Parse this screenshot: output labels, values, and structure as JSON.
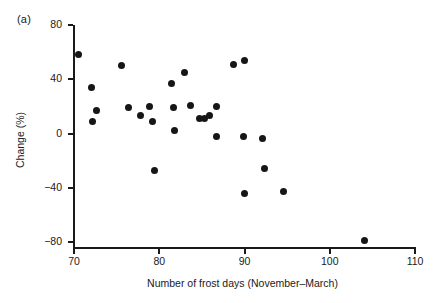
{
  "figure": {
    "panel_label": "(a)"
  },
  "chart_data": {
    "type": "scatter",
    "title": "",
    "xlabel": "Number of frost days (November–March)",
    "ylabel": "Change (%)",
    "xlim": [
      70,
      110
    ],
    "ylim": [
      -80,
      80
    ],
    "xticks": [
      70,
      80,
      90,
      100,
      110
    ],
    "xticklabels": [
      "70",
      "80",
      "90",
      "100",
      "110"
    ],
    "yticks": [
      80,
      40,
      0,
      -40,
      -80
    ],
    "yticklabels": [
      "80",
      "40",
      "0",
      "−40",
      "−80"
    ],
    "grid": false,
    "legend": null,
    "marker": "filled-circle",
    "marker_color": "#161616",
    "points": [
      {
        "x": 70.5,
        "y": 58
      },
      {
        "x": 72.1,
        "y": 34
      },
      {
        "x": 72.6,
        "y": 17
      },
      {
        "x": 72.2,
        "y": 9
      },
      {
        "x": 75.6,
        "y": 50
      },
      {
        "x": 76.4,
        "y": 19
      },
      {
        "x": 77.8,
        "y": 13
      },
      {
        "x": 78.8,
        "y": 20
      },
      {
        "x": 79.2,
        "y": 9
      },
      {
        "x": 79.4,
        "y": -27
      },
      {
        "x": 81.4,
        "y": 37
      },
      {
        "x": 81.7,
        "y": 19
      },
      {
        "x": 81.8,
        "y": 2
      },
      {
        "x": 83.0,
        "y": 45
      },
      {
        "x": 83.7,
        "y": 21
      },
      {
        "x": 84.7,
        "y": 11
      },
      {
        "x": 85.3,
        "y": 11
      },
      {
        "x": 85.9,
        "y": 13
      },
      {
        "x": 86.7,
        "y": 20
      },
      {
        "x": 86.7,
        "y": -2
      },
      {
        "x": 88.7,
        "y": 51
      },
      {
        "x": 90.0,
        "y": 54
      },
      {
        "x": 89.9,
        "y": -2
      },
      {
        "x": 90.0,
        "y": -44
      },
      {
        "x": 92.1,
        "y": -4
      },
      {
        "x": 92.3,
        "y": -26
      },
      {
        "x": 94.6,
        "y": -43
      },
      {
        "x": 104.1,
        "y": -79
      }
    ]
  }
}
